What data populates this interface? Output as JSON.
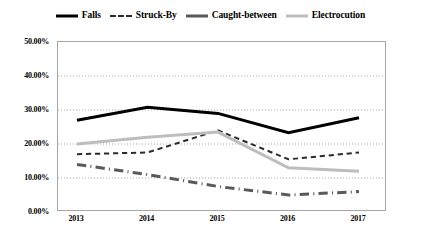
{
  "chart_data": {
    "type": "line",
    "title": "",
    "xlabel": "",
    "ylabel": "",
    "categories": [
      "2013",
      "2014",
      "2015",
      "2016",
      "2017"
    ],
    "x_tick_labels": [
      "2013",
      "2014",
      "2015",
      "2016",
      "2017"
    ],
    "y_tick_labels": [
      "0.00%",
      "10.00%",
      "20.00%",
      "30.00%",
      "40.00%",
      "50.00%"
    ],
    "y_tick_values": [
      0,
      10,
      20,
      30,
      40,
      50
    ],
    "ylim": [
      0,
      50
    ],
    "grid": true,
    "grid_axis": "y",
    "legend_position": "top-center",
    "series": [
      {
        "name": "Falls",
        "color": "#000000",
        "style": "solid",
        "width": 3,
        "values": [
          27.0,
          30.8,
          29.0,
          23.3,
          27.7
        ]
      },
      {
        "name": "Struck-By",
        "color": "#2b2b2b",
        "style": "dashed",
        "width": 2,
        "values": [
          17.0,
          17.5,
          24.0,
          15.5,
          17.5
        ]
      },
      {
        "name": "Caught-between",
        "color": "#5a5a5a",
        "style": "dashdot",
        "width": 3,
        "values": [
          14.0,
          11.0,
          7.5,
          5.0,
          6.0
        ]
      },
      {
        "name": "Electrocution",
        "color": "#bdbdbd",
        "style": "solid",
        "width": 3,
        "values": [
          20.0,
          22.0,
          23.5,
          13.0,
          12.0
        ]
      }
    ]
  },
  "legend": {
    "items": [
      {
        "label": "Falls",
        "icon": "line-solid-black-icon"
      },
      {
        "label": "Struck-By",
        "icon": "line-dashed-black-icon"
      },
      {
        "label": "Caught-between",
        "icon": "line-solid-gray-icon"
      },
      {
        "label": "Electrocution",
        "icon": "line-solid-lightgray-icon"
      }
    ]
  }
}
